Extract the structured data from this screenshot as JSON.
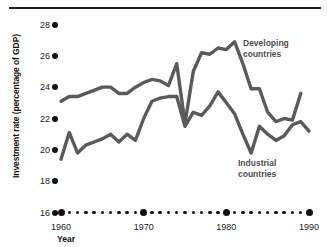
{
  "chart_data": {
    "type": "line",
    "title": "",
    "xlabel": "Year",
    "ylabel": "Investment rate (percentage of GDP)",
    "xlim": [
      1960,
      1990
    ],
    "ylim": [
      16,
      28
    ],
    "grid": false,
    "legend_position": "inline-annotation",
    "y_ticks": [
      28,
      26,
      24,
      22,
      20,
      18,
      16
    ],
    "x_ticks": [
      1960,
      1970,
      1980,
      1990
    ],
    "x_minor_ticks": [
      1961,
      1962,
      1963,
      1964,
      1965,
      1966,
      1967,
      1968,
      1969,
      1971,
      1972,
      1973,
      1974,
      1975,
      1976,
      1977,
      1978,
      1979,
      1981,
      1982,
      1983,
      1984,
      1985,
      1986,
      1987,
      1988,
      1989
    ],
    "x": [
      1960,
      1961,
      1962,
      1963,
      1964,
      1965,
      1966,
      1967,
      1968,
      1969,
      1970,
      1971,
      1972,
      1973,
      1974,
      1975,
      1976,
      1977,
      1978,
      1979,
      1980,
      1981,
      1982,
      1983,
      1984,
      1985,
      1986,
      1987,
      1988,
      1989,
      1990
    ],
    "series": [
      {
        "name": "Developing countries",
        "color": "#5a5a5a",
        "values": [
          23.1,
          23.4,
          23.4,
          23.6,
          23.8,
          24.0,
          24.0,
          23.6,
          23.6,
          24.0,
          24.3,
          24.5,
          24.4,
          24.1,
          25.5,
          21.7,
          25.0,
          26.2,
          26.1,
          26.5,
          26.4,
          26.9,
          25.5,
          23.9,
          23.9,
          22.4,
          21.8,
          22.0,
          21.9,
          23.6,
          null
        ]
      },
      {
        "name": "Industrial countries",
        "color": "#5a5a5a",
        "values": [
          19.4,
          21.1,
          19.8,
          20.3,
          20.5,
          20.7,
          21.0,
          20.5,
          21.0,
          20.6,
          22.0,
          23.1,
          23.3,
          23.4,
          23.4,
          21.5,
          22.4,
          22.2,
          22.8,
          23.7,
          23.0,
          22.3,
          21.0,
          19.8,
          21.5,
          21.0,
          20.6,
          20.9,
          21.6,
          21.8,
          21.2
        ]
      }
    ],
    "annotations": [
      {
        "text": "Developing countries",
        "series": "Developing countries"
      },
      {
        "text": "Industrial countries",
        "series": "Industrial countries"
      }
    ]
  },
  "axis": {
    "y_title": "Investment rate (percentage of GDP)",
    "x_title": "Year",
    "y_tick_labels": [
      "28",
      "26",
      "24",
      "22",
      "20",
      "18",
      "16"
    ],
    "x_tick_labels": [
      "1960",
      "1970",
      "1980",
      "1990"
    ]
  },
  "labels": {
    "developing_line1": "Developing",
    "developing_line2": "countries",
    "industrial_line1": "Industrial",
    "industrial_line2": "countries"
  },
  "colors": {
    "line": "#5a5a5a",
    "axis_text": "#1a1a1a",
    "label_text": "#4d4d4d",
    "rule": "#1a1a1a"
  }
}
